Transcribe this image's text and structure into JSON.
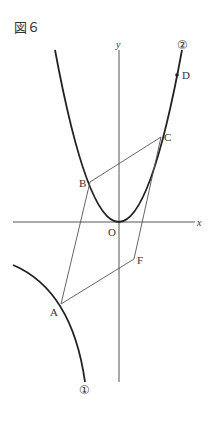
{
  "figure": {
    "title": "図６",
    "axis_labels": {
      "x": "x",
      "y": "y",
      "origin": "O"
    },
    "points": {
      "A": "A",
      "B": "B",
      "C": "C",
      "D": "D",
      "F": "F"
    },
    "curve_labels": {
      "curve1": "①",
      "curve2": "②"
    }
  }
}
